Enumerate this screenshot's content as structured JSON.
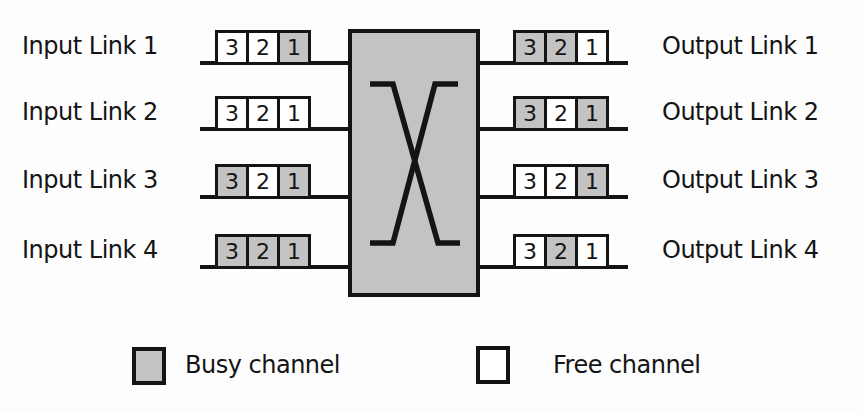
{
  "figure": {
    "type": "diagram",
    "colors": {
      "busy_channel": "#c3c3c3",
      "free_channel": "#ffffff",
      "line": "#141414",
      "switch_fill": "#c3c3c3",
      "background": "#fdfdfd"
    }
  },
  "switch": {
    "symbol": "crossbar-cross-icon"
  },
  "input_links": [
    {
      "label": "Input Link 1",
      "channels": [
        {
          "label": "3",
          "state": "free"
        },
        {
          "label": "2",
          "state": "free"
        },
        {
          "label": "1",
          "state": "busy"
        }
      ]
    },
    {
      "label": "Input Link 2",
      "channels": [
        {
          "label": "3",
          "state": "free"
        },
        {
          "label": "2",
          "state": "free"
        },
        {
          "label": "1",
          "state": "free"
        }
      ]
    },
    {
      "label": "Input Link 3",
      "channels": [
        {
          "label": "3",
          "state": "busy"
        },
        {
          "label": "2",
          "state": "free"
        },
        {
          "label": "1",
          "state": "busy"
        }
      ]
    },
    {
      "label": "Input Link 4",
      "channels": [
        {
          "label": "3",
          "state": "busy"
        },
        {
          "label": "2",
          "state": "busy"
        },
        {
          "label": "1",
          "state": "busy"
        }
      ]
    }
  ],
  "output_links": [
    {
      "label": "Output Link 1",
      "channels": [
        {
          "label": "3",
          "state": "busy"
        },
        {
          "label": "2",
          "state": "busy"
        },
        {
          "label": "1",
          "state": "free"
        }
      ]
    },
    {
      "label": "Output Link 2",
      "channels": [
        {
          "label": "3",
          "state": "busy"
        },
        {
          "label": "2",
          "state": "free"
        },
        {
          "label": "1",
          "state": "busy"
        }
      ]
    },
    {
      "label": "Output Link 3",
      "channels": [
        {
          "label": "3",
          "state": "free"
        },
        {
          "label": "2",
          "state": "free"
        },
        {
          "label": "1",
          "state": "busy"
        }
      ]
    },
    {
      "label": "Output Link 4",
      "channels": [
        {
          "label": "3",
          "state": "free"
        },
        {
          "label": "2",
          "state": "busy"
        },
        {
          "label": "1",
          "state": "free"
        }
      ]
    }
  ],
  "legend": {
    "busy": {
      "label": "Busy channel",
      "state": "busy"
    },
    "free": {
      "label": "Free channel",
      "state": "free"
    }
  }
}
